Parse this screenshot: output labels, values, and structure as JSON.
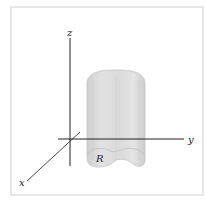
{
  "diagram": {
    "type": "3d-axes-with-solid",
    "axes": {
      "x_label": "x",
      "y_label": "y",
      "z_label": "z"
    },
    "solid": {
      "shape": "cylinder-over-region",
      "region_label": "R",
      "fill_color": "#d9d9d9",
      "edge_color": "#bdbdbd"
    },
    "colors": {
      "axis": "#222222",
      "frame": "#cfcfcf",
      "background": "#ffffff"
    }
  }
}
